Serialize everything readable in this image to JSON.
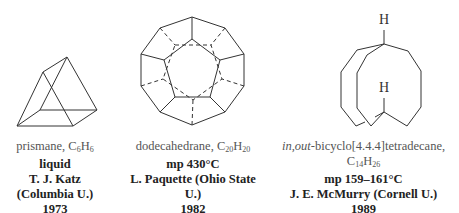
{
  "compounds": [
    {
      "name": "prismane",
      "formula": {
        "C": "6",
        "H": "6"
      },
      "property": "liquid",
      "chemist": "T. J. Katz",
      "institution": "(Columbia U.)",
      "year": "1973"
    },
    {
      "name": "dodecahedrane",
      "formula": {
        "C": "20",
        "H": "20"
      },
      "property": "mp 430°C",
      "chemist_institution": "L. Paquette (Ohio State U.)",
      "year": "1982"
    },
    {
      "name_prefix_italic": "in,out",
      "name": "-bicyclo[4.4.4]tetradecane",
      "formula": {
        "C": "14",
        "H": "26"
      },
      "property": "mp 159–161°C",
      "chemist_institution": "J. E. McMurry (Cornell U.)",
      "year": "1989"
    }
  ],
  "labels": {
    "h_top": "H",
    "h_inner": "H",
    "comma": ", ",
    "c": "C",
    "h": "H"
  }
}
